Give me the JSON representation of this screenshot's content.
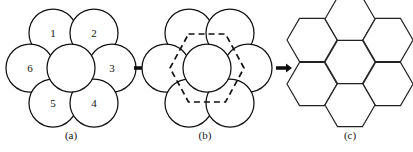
{
  "figure": {
    "background_color": "#ffffff",
    "line_color": "#111111",
    "panels": [
      {
        "id": "panel-a",
        "caption": "(a)",
        "caption_x": 71,
        "caption_y": 136,
        "kind": "circle-cluster",
        "description": "Seven tangent circles: one center circle surrounded by six numbered circles",
        "circle_radius": 24,
        "center_circle": {
          "cx": 71,
          "cy": 68,
          "label": ""
        },
        "ring_circles": [
          {
            "label": "1",
            "cx": 53,
            "cy": 33
          },
          {
            "label": "2",
            "cx": 94,
            "cy": 33
          },
          {
            "label": "3",
            "cx": 112,
            "cy": 68
          },
          {
            "label": "4",
            "cx": 94,
            "cy": 103
          },
          {
            "label": "5",
            "cx": 53,
            "cy": 103
          },
          {
            "label": "6",
            "cx": 30,
            "cy": 68
          }
        ]
      },
      {
        "id": "panel-b",
        "caption": "(b)",
        "caption_x": 205,
        "caption_y": 136,
        "kind": "circle-cluster-with-hexagon",
        "description": "Same seven circles with a dashed flat-top hexagon inscribed through the circle intersections",
        "circle_radius": 24,
        "center_circle": {
          "cx": 207,
          "cy": 68,
          "label": ""
        },
        "ring_circles": [
          {
            "label": "",
            "cx": 189,
            "cy": 33
          },
          {
            "label": "",
            "cx": 230,
            "cy": 33
          },
          {
            "label": "",
            "cx": 248,
            "cy": 68
          },
          {
            "label": "",
            "cx": 230,
            "cy": 103
          },
          {
            "label": "",
            "cx": 189,
            "cy": 103
          },
          {
            "label": "",
            "cx": 166,
            "cy": 68
          }
        ],
        "dashed_hexagon": {
          "cx": 207,
          "cy": 68,
          "width": 74,
          "height": 68,
          "orientation": "flat-top",
          "style": "dashed"
        }
      },
      {
        "id": "panel-c",
        "caption": "(c)",
        "caption_x": 350,
        "caption_y": 136,
        "kind": "hexagon-honeycomb",
        "description": "Seven tessellated flat-top hexagons forming a honeycomb cluster",
        "hex_radius": 25,
        "center_hexagon": {
          "cx": 350,
          "cy": 62
        },
        "ring_hexagons": [
          {
            "cx": 350,
            "cy": 19
          },
          {
            "cx": 388,
            "cy": 40
          },
          {
            "cx": 388,
            "cy": 84
          },
          {
            "cx": 350,
            "cy": 105
          },
          {
            "cx": 312,
            "cy": 84
          },
          {
            "cx": 312,
            "cy": 40
          }
        ]
      }
    ],
    "arrows": [
      {
        "id": "arrow-a-to-b",
        "from": "panel-a",
        "to": "panel-b",
        "x": 134,
        "y": 68,
        "length": 15,
        "direction": "right"
      },
      {
        "id": "arrow-b-to-c",
        "from": "panel-b",
        "to": "panel-c",
        "x": 276,
        "y": 68,
        "length": 15,
        "direction": "right"
      }
    ]
  }
}
